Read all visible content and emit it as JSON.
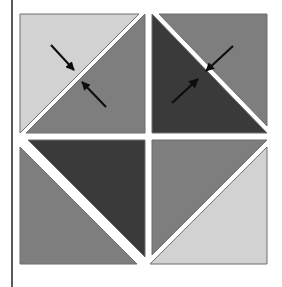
{
  "page": {
    "background_color": "#FFFFFF",
    "margin_rule": {
      "name": "vertical-margin-rule",
      "color": "#5A5A5A",
      "x": 11,
      "width": 2
    }
  },
  "figure": {
    "title": "",
    "caption": "",
    "x": 19,
    "y": 13,
    "width": 249,
    "height": 252,
    "border_color": "#6E6E6E",
    "gap_color": "#FFFFFF",
    "gap_width": 7,
    "diagonal_gap_width": 8,
    "palette": {
      "light_gray": "#D2D2D2",
      "medium_gray": "#7E7E7E",
      "dark_gray": "#3A3A3A",
      "white": "#FFFFFF",
      "arrow_color": "#0D0D0D",
      "outline": "#6E6E6E"
    },
    "quadrants": [
      {
        "id": "top-left",
        "name": "quadrant-top-left",
        "diagonal": "bottom-left-to-top-right",
        "triangles": [
          {
            "position": "upper-left",
            "fill": "#D2D2D2",
            "tone": "light"
          },
          {
            "position": "lower-right",
            "fill": "#7E7E7E",
            "tone": "medium"
          }
        ],
        "arrows": [
          {
            "id": "arrow-tl-upper",
            "from": [
              32,
              32
            ],
            "to": [
              55,
              57
            ],
            "direction": "down-right",
            "points_at": "diagonal-edge"
          },
          {
            "id": "arrow-tl-lower",
            "from": [
              87,
              94
            ],
            "to": [
              63,
              69
            ],
            "direction": "up-left",
            "points_at": "diagonal-edge"
          }
        ]
      },
      {
        "id": "top-right",
        "name": "quadrant-top-right",
        "diagonal": "top-left-to-bottom-right",
        "triangles": [
          {
            "position": "lower-left",
            "fill": "#3A3A3A",
            "tone": "dark"
          },
          {
            "position": "upper-right",
            "fill": "#7E7E7E",
            "tone": "medium"
          }
        ],
        "arrows": [
          {
            "id": "arrow-tr-upper",
            "from": [
              214,
              33
            ],
            "to": [
              187,
              58
            ],
            "direction": "down-left",
            "points_at": "diagonal-edge"
          },
          {
            "id": "arrow-tr-lower",
            "from": [
              153,
              90
            ],
            "to": [
              179,
              66
            ],
            "direction": "up-right",
            "points_at": "diagonal-edge"
          }
        ]
      },
      {
        "id": "bottom-left",
        "name": "quadrant-bottom-left",
        "diagonal": "top-left-to-bottom-right",
        "triangles": [
          {
            "position": "lower-left",
            "fill": "#7E7E7E",
            "tone": "medium"
          },
          {
            "position": "upper-right",
            "fill": "#3A3A3A",
            "tone": "dark"
          }
        ],
        "arrows": []
      },
      {
        "id": "bottom-right",
        "name": "quadrant-bottom-right",
        "diagonal": "bottom-left-to-top-right",
        "triangles": [
          {
            "position": "upper-left",
            "fill": "#7E7E7E",
            "tone": "medium"
          },
          {
            "position": "lower-right",
            "fill": "#D2D2D2",
            "tone": "light"
          }
        ],
        "arrows": []
      }
    ]
  }
}
